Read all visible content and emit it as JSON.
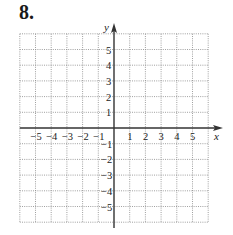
{
  "problem": {
    "number": "8."
  },
  "graph": {
    "x_axis_label": "x",
    "y_axis_label": "y",
    "x_range": [
      -6,
      6
    ],
    "y_range": [
      -6,
      6
    ],
    "grid_style": "dotted",
    "x_tick_labels": [
      "-5",
      "-4",
      "-3",
      "-2",
      "-1",
      "1",
      "2",
      "3",
      "4",
      "5"
    ],
    "y_tick_labels": [
      "5",
      "4",
      "3",
      "2",
      "1",
      "-1",
      "-2",
      "-3",
      "-4",
      "-5"
    ],
    "colors": {
      "axis": "#333333",
      "grid": "#888888",
      "text": "#222222"
    }
  }
}
